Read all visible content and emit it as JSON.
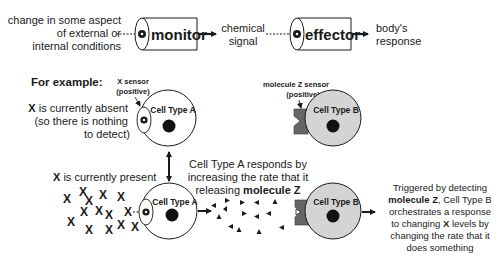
{
  "top_flow": {
    "stimulus_text": [
      "change in some aspect",
      "of external or",
      "internal conditions"
    ],
    "monitor_label": "monitor",
    "signal_text": [
      "chemical",
      "signal"
    ],
    "effector_label": "effector",
    "response_text": [
      "body's",
      "response"
    ]
  },
  "example": {
    "heading": "For example:",
    "x_sensor_label": [
      "X sensor",
      "(positive)"
    ],
    "z_sensor_label": [
      "molecule Z sensor",
      "(positive)"
    ],
    "absent_text": {
      "line1_bold": "X",
      "line1_rest": " is currently absent",
      "line2": "(so there is nothing",
      "line3": "to detect)"
    },
    "present_text": {
      "bold": "X",
      "rest": " is currently present"
    },
    "cell_a_label": "Cell Type A",
    "cell_b_label": "Cell Type B",
    "cell_a_response": {
      "line1": "Cell Type A responds by",
      "line2": "increasing the rate that it",
      "line3_pre": "releasing ",
      "line3_bold": "molecule Z"
    },
    "cell_b_response": {
      "line1": "Triggered by detecting",
      "line2_bold": "molecule Z",
      "line2_rest": ", Cell Type B",
      "line3": "orchestrates a response",
      "line4_pre": "to changing ",
      "line4_bold": "X",
      "line4_rest": " levels by",
      "line5": "changing the rate that it",
      "line6": "does something"
    },
    "x_symbol": "X"
  },
  "colors": {
    "stroke": "#1a1a1a",
    "cell_b_fill": "#d4d4d4",
    "sensor_fill": "#666666",
    "nucleus": "#111111"
  }
}
